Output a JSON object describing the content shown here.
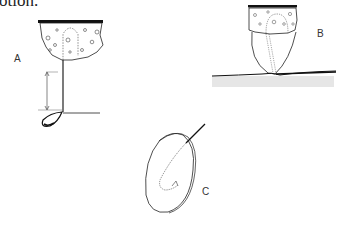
{
  "document": {
    "caption_fragment": "otion.",
    "figure": {
      "panels": [
        {
          "label": "A",
          "description": "Agar block with hyphal strand hanging down; measured length arrow; droplet at tip on surface line"
        },
        {
          "label": "B",
          "description": "Agar block atop transparent dome resting on a substrate surface with dotted hyphal channel"
        },
        {
          "label": "C",
          "description": "Oval disc (seed/tuber) with needle inserted; dotted hooked path inside"
        }
      ]
    },
    "colors": {
      "ink": "#1a1a1a",
      "background": "#ffffff",
      "substrate": "#e6e6e6"
    }
  }
}
